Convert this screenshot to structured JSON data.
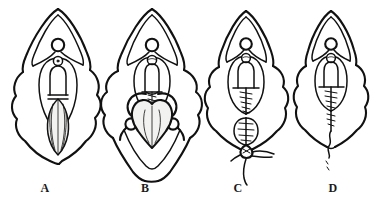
{
  "figure": {
    "background_color": "#ffffff",
    "ink_color": "#111111",
    "shade_color": "#f2f2f0",
    "width": 376,
    "height": 206,
    "panel_count": 4,
    "style": "black ink line drawing, no fill"
  },
  "panels": [
    {
      "id": "panel-a",
      "label": "A",
      "label_x": 45,
      "label_y": 188,
      "center_x": 58,
      "caption": "Stage A: intact anatomy with elongated central ovoid structure, no sutures",
      "has_sutures": false,
      "suture_count": 0,
      "features": [
        "outer pointed hood with double contour at top",
        "small circle at hood apex junction",
        "outer irregular lobed body outline",
        "inner oval ring",
        "small circle above inner dome",
        "central dome/bell shape",
        "long vertical shaded ovoid below dome with internal longitudinal lines"
      ]
    },
    {
      "id": "panel-b",
      "label": "B",
      "label_x": 145,
      "label_y": 188,
      "center_x": 152,
      "caption": "Stage B: retractors in place exposing heart-shaped structure",
      "has_sutures": false,
      "suture_count": 0,
      "features": [
        "outer pointed hood with double contour at top",
        "small circle at hood apex junction",
        "outer lobed body outline widened by traction",
        "inner oval ring",
        "small circle above inner dome",
        "central dome/bell shape",
        "large heart/shield shaped structure with central vertical line",
        "paired curved retractor hooks with small ring handles at left and right",
        "lower V-shaped tissue fold extending below"
      ]
    },
    {
      "id": "panel-c",
      "label": "C",
      "label_x": 238,
      "label_y": 188,
      "center_x": 246,
      "caption": "Stage C: running sutures closing upper and lower segments, thread tail hanging",
      "has_sutures": true,
      "suture_count": 12,
      "features": [
        "outer pointed hood with double contour at top",
        "small circle at hood apex junction",
        "outer lobed body outline",
        "inner oval ring",
        "small circle above inner dome",
        "central dome/bell shape",
        "horizontal closure line across dome base",
        "laddered running suture down midline within oval",
        "second small sutured oval below the main oval",
        "knot with lateral thread ends",
        "long thread tail trailing downward"
      ]
    },
    {
      "id": "panel-d",
      "label": "D",
      "label_x": 333,
      "label_y": 188,
      "center_x": 331,
      "caption": "Stage D: completed closure with single midline suture line and free thread end",
      "has_sutures": true,
      "suture_count": 9,
      "features": [
        "outer pointed hood with double contour at top",
        "small circle at hood apex junction",
        "outer lobed body outline, narrower than C",
        "inner oval ring",
        "small circle above inner dome",
        "central dome/bell shape",
        "horizontal closure line across dome base",
        "laddered running suture down midline within oval",
        "midline suture continuing below the oval",
        "wavy free thread end with dashed tail"
      ]
    }
  ],
  "labels": {
    "a": "A",
    "b": "B",
    "c": "C",
    "d": "D"
  }
}
